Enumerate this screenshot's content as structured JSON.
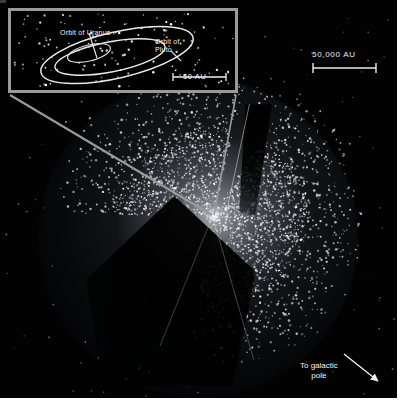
{
  "figure": {
    "background_color": "#000000",
    "star_color": "#ffffff",
    "line_color": "#9a9a9a",
    "text_color": "#f2f2f2",
    "width": 401,
    "height": 404
  },
  "inset": {
    "name": "inner-solar-system-inset",
    "border_color": "#9a9a9a",
    "labels": {
      "uranus": "Orbit of Uranus",
      "pluto_line1": "Orbit of",
      "pluto_line2": "Pluto"
    },
    "scale": {
      "label": "50 AU",
      "value": 50,
      "unit": "AU"
    },
    "orbits": [
      {
        "name": "orbit-of-uranus",
        "label": "Orbit of Uranus"
      },
      {
        "name": "orbit-of-pluto",
        "label": "Orbit of Pluto"
      },
      {
        "name": "orbit-inner",
        "label": ""
      }
    ]
  },
  "main_scale": {
    "label": "50,000 AU",
    "value": 50000,
    "unit": "AU"
  },
  "galactic": {
    "label_line1": "To galactic",
    "label_line2": "pole",
    "arrow_direction": "down-right"
  }
}
